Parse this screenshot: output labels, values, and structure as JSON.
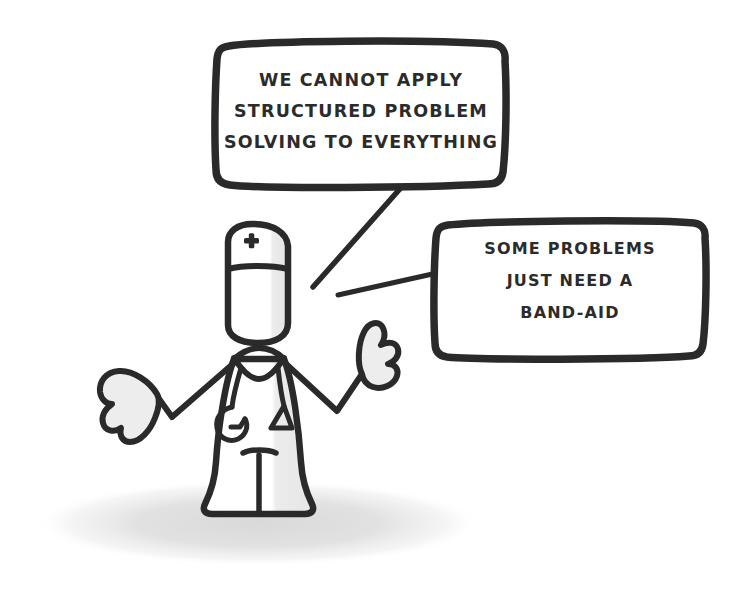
{
  "scene": {
    "width": 738,
    "height": 597,
    "background_color": "#ffffff",
    "ink_color": "#2a2a2a",
    "text_color": "#2b2b2b",
    "shadow_color": "#e2e2e2",
    "shading_color": "#e8e8e8"
  },
  "speech_bubbles": [
    {
      "id": "bubble-top-left",
      "lines": [
        "WE CANNOT APPLY",
        "STRUCTURED PROBLEM",
        "SOLVING TO EVERYTHING"
      ]
    },
    {
      "id": "bubble-right",
      "lines": [
        "SOME PROBLEMS",
        "JUST NEED A",
        "BAND-AID"
      ]
    }
  ],
  "character": {
    "name": "nurse-doctor-figure",
    "cap_symbol": "medical-cross",
    "accessory": "stethoscope",
    "pose": "shrugging"
  }
}
